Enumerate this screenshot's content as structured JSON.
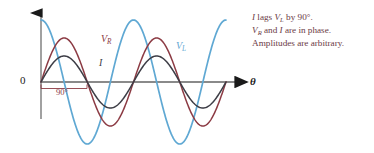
{
  "figure": {
    "background_color": "#ffffff",
    "axis_color": "#7f7f7f",
    "origin_label": "0",
    "x_axis_label": "θ",
    "phase_span_label": "90°"
  },
  "curves": [
    {
      "name": "V_L",
      "label_html": "V<span class=\"sub\">L</span>",
      "label_text": "VL",
      "color": "#5fa8d3",
      "phase_deg": 90,
      "amplitude": 62,
      "description": "voltage across inductor, leads current by 90 degrees"
    },
    {
      "name": "V_R",
      "label_html": "V<span class=\"sub\">R</span>",
      "label_text": "VR",
      "color": "#8c3b44",
      "phase_deg": 0,
      "amplitude": 44,
      "description": "voltage across resistor, in phase with current"
    },
    {
      "name": "I",
      "label_html": "I",
      "label_text": "I",
      "color": "#3d3d46",
      "phase_deg": 0,
      "amplitude": 26,
      "description": "current, in phase with V_R"
    }
  ],
  "annotations": {
    "lines": [
      "I lags V_L by 90°.",
      "V_R and I are in phase.",
      "Amplitudes are arbitrary."
    ],
    "line1_html": "<i>I</i> lags <i>V</i><span class=\"sub\">L</span> by 90°.",
    "line2_html": "<i>V</i><span class=\"sub\">R</span> and <i>I</i> are in phase.",
    "line3_html": "Amplitudes are arbitrary.",
    "color": "#6b3a45"
  },
  "chart_data": {
    "type": "line",
    "title": "",
    "xlabel": "θ",
    "ylabel": "",
    "xlim": [
      0,
      720
    ],
    "ylim": [
      -62,
      62
    ],
    "grid": false,
    "legend": "inline-curve-labels",
    "x_unit": "degrees",
    "x": [
      0,
      45,
      90,
      135,
      180,
      225,
      270,
      315,
      360,
      405,
      450,
      495,
      540,
      585,
      630,
      675,
      720
    ],
    "series": [
      {
        "name": "V_L",
        "label": "VL",
        "color": "#5fa8d3",
        "form": "62*cos(theta)",
        "amplitude": 62,
        "phase_deg": 90,
        "values": [
          62,
          43.8,
          0,
          -43.8,
          -62,
          -43.8,
          0,
          43.8,
          62,
          43.8,
          0,
          -43.8,
          -62,
          -43.8,
          0,
          43.8,
          62
        ]
      },
      {
        "name": "V_R",
        "label": "VR",
        "color": "#8c3b44",
        "form": "44*sin(theta)",
        "amplitude": 44,
        "phase_deg": 0,
        "values": [
          0,
          31.1,
          44,
          31.1,
          0,
          -31.1,
          -44,
          -31.1,
          0,
          31.1,
          44,
          31.1,
          0,
          -31.1,
          -44,
          -31.1,
          0
        ]
      },
      {
        "name": "I",
        "label": "I",
        "color": "#3d3d46",
        "form": "26*sin(theta)",
        "amplitude": 26,
        "phase_deg": 0,
        "values": [
          0,
          18.4,
          26,
          18.4,
          0,
          -18.4,
          -26,
          -18.4,
          0,
          18.4,
          26,
          18.4,
          0,
          -18.4,
          -26,
          -18.4,
          0
        ]
      }
    ],
    "annotations": [
      {
        "text": "0",
        "x": 0,
        "y": 0,
        "role": "origin-label"
      },
      {
        "text": "90°",
        "x": 45,
        "y": -12,
        "role": "phase-span-bracket"
      },
      {
        "text": "VR",
        "x": 120,
        "y": 44,
        "role": "curve-label"
      },
      {
        "text": "VL",
        "x": 400,
        "y": 30,
        "role": "curve-label"
      },
      {
        "text": "I",
        "x": 115,
        "y": 20,
        "role": "curve-label"
      }
    ]
  }
}
